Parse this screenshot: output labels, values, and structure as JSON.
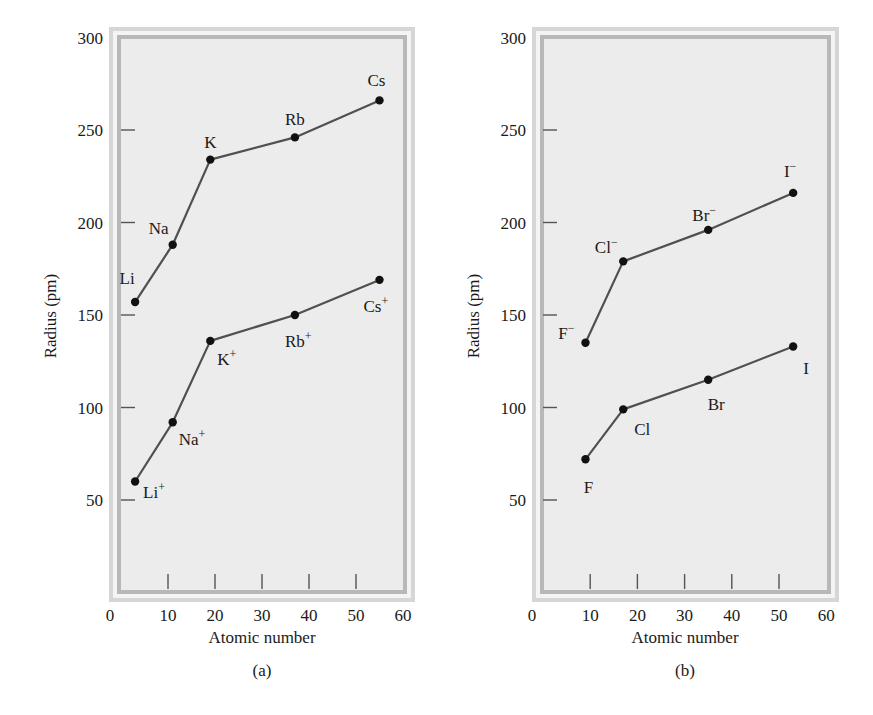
{
  "figure": {
    "background": "#ffffff",
    "plot_interior": "#ececec",
    "frame_outer": "#d6d6d6",
    "frame_inner_band": "#b8b8b8",
    "line_color": "#505050",
    "dot_color": "#111111"
  },
  "chart_data": [
    {
      "id": "a",
      "type": "line",
      "caption": "(a)",
      "title": "",
      "xlabel": "Atomic number",
      "ylabel": "Radius (pm)",
      "xlim": [
        0,
        60
      ],
      "ylim": [
        0,
        300
      ],
      "xticks": [
        0,
        10,
        20,
        30,
        40,
        50,
        60
      ],
      "yticks": [
        50,
        100,
        150,
        200,
        250,
        300
      ],
      "grid": false,
      "legend": null,
      "series": [
        {
          "name": "Alkali metal atoms",
          "points": [
            {
              "label": "Li",
              "sup": "",
              "x": 3,
              "y": 157
            },
            {
              "label": "Na",
              "sup": "",
              "x": 11,
              "y": 188
            },
            {
              "label": "K",
              "sup": "",
              "x": 19,
              "y": 234
            },
            {
              "label": "Rb",
              "sup": "",
              "x": 37,
              "y": 246
            },
            {
              "label": "Cs",
              "sup": "",
              "x": 55,
              "y": 266
            }
          ]
        },
        {
          "name": "Alkali metal cations",
          "points": [
            {
              "label": "Li",
              "sup": "+",
              "x": 3,
              "y": 60
            },
            {
              "label": "Na",
              "sup": "+",
              "x": 11,
              "y": 92
            },
            {
              "label": "K",
              "sup": "+",
              "x": 19,
              "y": 136
            },
            {
              "label": "Rb",
              "sup": "+",
              "x": 37,
              "y": 150
            },
            {
              "label": "Cs",
              "sup": "+",
              "x": 55,
              "y": 169
            }
          ]
        }
      ]
    },
    {
      "id": "b",
      "type": "line",
      "caption": "(b)",
      "title": "",
      "xlabel": "Atomic number",
      "ylabel": "Radius (pm)",
      "xlim": [
        0,
        60
      ],
      "ylim": [
        0,
        300
      ],
      "xticks": [
        0,
        10,
        20,
        30,
        40,
        50,
        60
      ],
      "yticks": [
        50,
        100,
        150,
        200,
        250,
        300
      ],
      "grid": false,
      "legend": null,
      "series": [
        {
          "name": "Halide anions",
          "points": [
            {
              "label": "F",
              "sup": "−",
              "x": 9,
              "y": 135
            },
            {
              "label": "Cl",
              "sup": "−",
              "x": 17,
              "y": 179
            },
            {
              "label": "Br",
              "sup": "−",
              "x": 35,
              "y": 196
            },
            {
              "label": "I",
              "sup": "−",
              "x": 53,
              "y": 216
            }
          ]
        },
        {
          "name": "Halogen atoms",
          "points": [
            {
              "label": "F",
              "sup": "",
              "x": 9,
              "y": 72
            },
            {
              "label": "Cl",
              "sup": "",
              "x": 17,
              "y": 99
            },
            {
              "label": "Br",
              "sup": "",
              "x": 35,
              "y": 115
            },
            {
              "label": "I",
              "sup": "",
              "x": 53,
              "y": 133
            }
          ]
        }
      ]
    }
  ]
}
